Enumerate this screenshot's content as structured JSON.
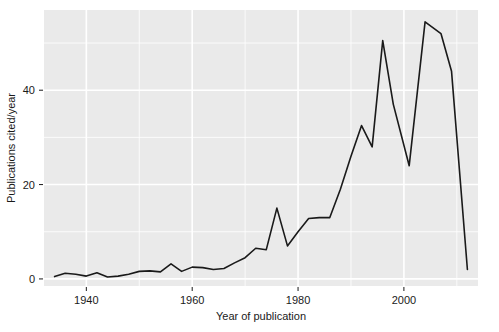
{
  "chart_data": {
    "type": "line",
    "title": "",
    "xlabel": "Year of publication",
    "ylabel": "Publications cited/year",
    "xlim": [
      1932,
      2014
    ],
    "ylim": [
      -1.5,
      57
    ],
    "grid": true,
    "grid_style": "white gridlines on light-gray panel",
    "legend": "none",
    "x_ticks": [
      1940,
      1960,
      1980,
      2000
    ],
    "x_tick_labels": [
      "1940",
      "1960",
      "1980",
      "2000"
    ],
    "x_minor_ticks": [
      1950,
      1970,
      1990,
      2010
    ],
    "y_ticks": [
      0,
      20,
      40
    ],
    "y_tick_labels": [
      "0",
      "20",
      "40"
    ],
    "y_minor_ticks": [
      10,
      30,
      50
    ],
    "series": [
      {
        "name": "Publications cited/year",
        "color": "#1a1a1a",
        "line_width": 1.6,
        "x": [
          1934,
          1936,
          1938,
          1940,
          1942,
          1944,
          1946,
          1948,
          1950,
          1952,
          1954,
          1956,
          1958,
          1960,
          1962,
          1964,
          1966,
          1968,
          1970,
          1972,
          1974,
          1976,
          1978,
          1980,
          1982,
          1984,
          1986,
          1988,
          1990,
          1992,
          1994,
          1996,
          1998,
          2001,
          2004,
          2007,
          2009,
          2012
        ],
        "y": [
          0.5,
          1.2,
          1.0,
          0.6,
          1.3,
          0.4,
          0.6,
          1.0,
          1.6,
          1.7,
          1.5,
          3.2,
          1.6,
          2.5,
          2.4,
          2.0,
          2.2,
          3.4,
          4.5,
          6.5,
          6.2,
          15.0,
          7.0,
          10.0,
          12.8,
          13.0,
          13.0,
          19.0,
          26.0,
          32.5,
          28.0,
          50.5,
          37.0,
          24.0,
          54.5,
          52.0,
          44.0,
          2.0
        ]
      }
    ]
  },
  "panel": {
    "background": "#eaeaea",
    "gridline_color": "#ffffff",
    "plot_left": 44,
    "plot_top": 10,
    "plot_right": 478,
    "plot_bottom": 286
  }
}
